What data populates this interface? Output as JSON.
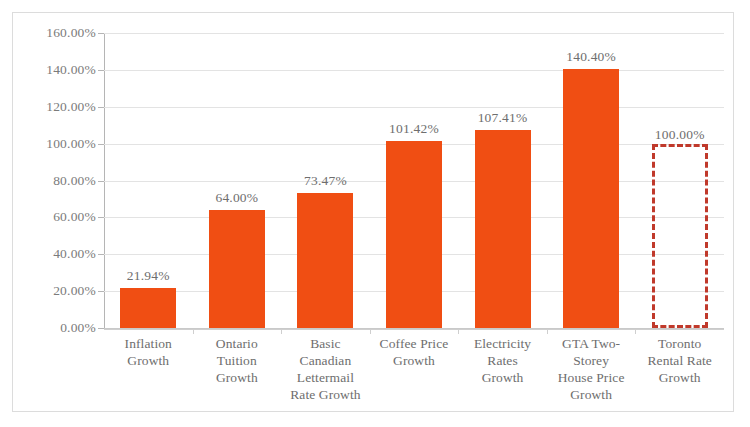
{
  "chart_data": {
    "type": "bar",
    "title": "",
    "subtitle": "",
    "xlabel": "",
    "ylabel": "",
    "ylim": [
      0,
      160
    ],
    "ytick_labels": [
      "160.00%",
      "140.00%",
      "120.00%",
      "100.00%",
      "80.00%",
      "60.00%",
      "40.00%",
      "20.00%",
      "0.00%"
    ],
    "ytick_values": [
      160,
      140,
      120,
      100,
      80,
      60,
      40,
      20,
      0
    ],
    "grid": true,
    "legend": "none",
    "categories": [
      "Inflation Growth",
      "Ontario Tuition Growth",
      "Basic Canadian Lettermail Rate Growth",
      "Coffee Price Growth",
      "Electricity Rates Growth",
      "GTA Two-Storey House Price Growth",
      "Toronto Rental Rate Growth"
    ],
    "category_lines": [
      [
        "Inflation",
        "Growth"
      ],
      [
        "Ontario",
        "Tuition",
        "Growth"
      ],
      [
        "Basic",
        "Canadian",
        "Lettermail",
        "Rate Growth"
      ],
      [
        "Coffee Price",
        "Growth"
      ],
      [
        "Electricity",
        "Rates",
        "Growth"
      ],
      [
        "GTA Two-",
        "Storey",
        "House Price",
        "Growth"
      ],
      [
        "Toronto",
        "Rental Rate",
        "Growth"
      ]
    ],
    "values": [
      21.94,
      64.0,
      73.47,
      101.42,
      107.41,
      140.4,
      100.0
    ],
    "value_labels": [
      "21.94%",
      "64.00%",
      "73.47%",
      "101.42%",
      "107.41%",
      "140.40%",
      "100.00%"
    ],
    "bar_styles": [
      "filled",
      "filled",
      "filled",
      "filled",
      "filled",
      "filled",
      "dashed-outline"
    ],
    "colors": {
      "bar_fill": "#f04e13",
      "outline_bar_stroke": "#c0392b",
      "gridline": "#e3e3e3",
      "axis_line": "#b5b5b5",
      "label_text": "#6e6e6e",
      "frame_border": "#dcdcdc",
      "background": "#ffffff"
    }
  }
}
